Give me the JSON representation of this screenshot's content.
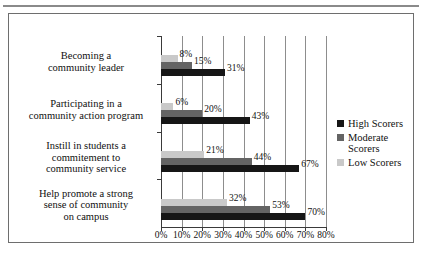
{
  "chart_data": {
    "type": "bar",
    "orientation": "horizontal",
    "title": "",
    "xlabel": "",
    "ylabel": "",
    "xlim": [
      0,
      80
    ],
    "xticks": [
      "0%",
      "10%",
      "20%",
      "30%",
      "40%",
      "50%",
      "60%",
      "70%",
      "80%"
    ],
    "xtick_values": [
      0,
      10,
      20,
      30,
      40,
      50,
      60,
      70,
      80
    ],
    "grid": true,
    "legend_position": "right",
    "categories": [
      "Becoming a\ncommunity leader",
      "Participating in a\ncommunity action program",
      "Instill in students a\ncommitement to\ncommunity service",
      "Help promote a strong\nsense of  community\non campus"
    ],
    "category_lines": [
      [
        "Becoming a",
        "community leader"
      ],
      [
        "Participating in a",
        "community action program"
      ],
      [
        "Instill in students a",
        "commitement to",
        "community service"
      ],
      [
        "Help promote a strong",
        "sense of  community",
        "on campus"
      ]
    ],
    "series": [
      {
        "name": "High Scorers",
        "color": "#161616",
        "values": [
          31,
          43,
          67,
          70
        ],
        "labels": [
          "31%",
          "43%",
          "67%",
          "70%"
        ]
      },
      {
        "name": "Moderate Scorers",
        "color": "#646464",
        "values": [
          15,
          20,
          44,
          53
        ],
        "labels": [
          "15%",
          "20%",
          "44%",
          "53%"
        ]
      },
      {
        "name": "Low Scorers",
        "color": "#c9c9c9",
        "values": [
          8,
          6,
          21,
          32
        ],
        "labels": [
          "8%",
          "6%",
          "21%",
          "32%"
        ]
      }
    ]
  },
  "legend": {
    "entries": [
      {
        "label": "High Scorers",
        "lines": [
          "High Scorers"
        ],
        "swatch": "high"
      },
      {
        "label": "Moderate Scorers",
        "lines": [
          "Moderate",
          "Scorers"
        ],
        "swatch": "moderate"
      },
      {
        "label": "Low Scorers",
        "lines": [
          "Low Scorers"
        ],
        "swatch": "low"
      }
    ]
  }
}
